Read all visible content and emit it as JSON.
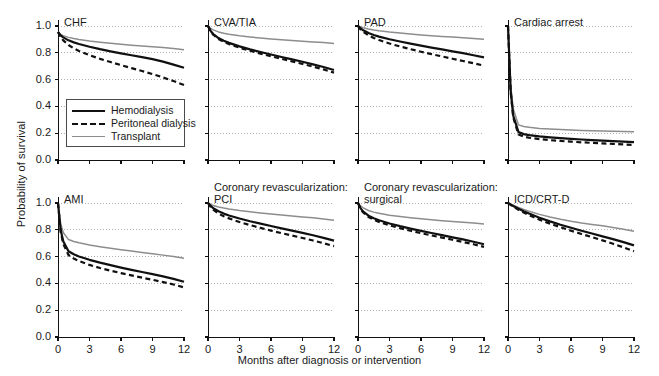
{
  "chart_data": {
    "type": "line",
    "title": "",
    "xlabel": "Months after diagnosis or intervention",
    "ylabel": "Probability of survival",
    "xlim": [
      0,
      12
    ],
    "ylim": [
      0,
      1.0
    ],
    "xticks": [
      "0",
      "3",
      "6",
      "9",
      "12"
    ],
    "xtick_values": [
      0,
      3,
      6,
      9,
      12
    ],
    "yticks": [
      "0.0",
      "0.2",
      "0.4",
      "0.6",
      "0.8",
      "1.0"
    ],
    "ytick_values": [
      0.0,
      0.2,
      0.4,
      0.6,
      0.8,
      1.0
    ],
    "grid": "horizontal-dotted",
    "legend_position": "inside-panel-1-lower-left",
    "legend": [
      {
        "name": "Hemodialysis",
        "style": "solid",
        "color": "#101010",
        "width": 2.2
      },
      {
        "name": "Peritoneal dialysis",
        "style": "dashed",
        "color": "#101010",
        "width": 2.2
      },
      {
        "name": "Transplant",
        "style": "solid",
        "color": "#8d8d8d",
        "width": 1.5
      }
    ],
    "x": [
      0,
      0.25,
      0.5,
      1,
      1.5,
      2,
      3,
      4,
      5,
      6,
      7,
      8,
      9,
      10,
      11,
      12
    ],
    "panels": [
      {
        "title": "CHF",
        "row": 0,
        "col": 0,
        "series": [
          {
            "name": "Hemodialysis",
            "values": [
              0.955,
              0.93,
              0.915,
              0.893,
              0.878,
              0.866,
              0.845,
              0.827,
              0.811,
              0.796,
              0.782,
              0.768,
              0.753,
              0.734,
              0.712,
              0.688
            ]
          },
          {
            "name": "Peritoneal dialysis",
            "values": [
              0.955,
              0.918,
              0.893,
              0.858,
              0.833,
              0.814,
              0.782,
              0.755,
              0.731,
              0.708,
              0.686,
              0.664,
              0.641,
              0.616,
              0.589,
              0.56
            ]
          },
          {
            "name": "Transplant",
            "values": [
              0.955,
              0.938,
              0.928,
              0.915,
              0.906,
              0.899,
              0.888,
              0.879,
              0.871,
              0.864,
              0.857,
              0.851,
              0.845,
              0.839,
              0.832,
              0.823
            ]
          }
        ]
      },
      {
        "title": "CVA/TIA",
        "row": 0,
        "col": 1,
        "series": [
          {
            "name": "Hemodialysis",
            "values": [
              1.0,
              0.963,
              0.94,
              0.91,
              0.89,
              0.874,
              0.848,
              0.826,
              0.806,
              0.787,
              0.769,
              0.751,
              0.733,
              0.714,
              0.694,
              0.672
            ]
          },
          {
            "name": "Peritoneal dialysis",
            "values": [
              1.0,
              0.96,
              0.935,
              0.903,
              0.882,
              0.865,
              0.838,
              0.815,
              0.794,
              0.774,
              0.755,
              0.736,
              0.717,
              0.697,
              0.676,
              0.652
            ]
          },
          {
            "name": "Transplant",
            "values": [
              1.0,
              0.983,
              0.971,
              0.956,
              0.946,
              0.939,
              0.927,
              0.918,
              0.91,
              0.903,
              0.897,
              0.891,
              0.886,
              0.881,
              0.876,
              0.87
            ]
          }
        ]
      },
      {
        "title": "PAD",
        "row": 0,
        "col": 2,
        "series": [
          {
            "name": "Hemodialysis",
            "values": [
              1.0,
              0.982,
              0.968,
              0.948,
              0.933,
              0.921,
              0.901,
              0.884,
              0.868,
              0.853,
              0.839,
              0.825,
              0.811,
              0.797,
              0.782,
              0.766
            ]
          },
          {
            "name": "Peritoneal dialysis",
            "values": [
              1.0,
              0.974,
              0.956,
              0.93,
              0.911,
              0.895,
              0.869,
              0.847,
              0.827,
              0.808,
              0.79,
              0.773,
              0.756,
              0.739,
              0.722,
              0.704
            ]
          },
          {
            "name": "Transplant",
            "values": [
              1.0,
              0.993,
              0.987,
              0.978,
              0.971,
              0.965,
              0.955,
              0.947,
              0.94,
              0.933,
              0.927,
              0.922,
              0.917,
              0.912,
              0.907,
              0.901
            ]
          }
        ]
      },
      {
        "title": "Cardiac arrest",
        "row": 0,
        "col": 3,
        "series": [
          {
            "name": "Hemodialysis",
            "values": [
              1.0,
              0.52,
              0.33,
              0.208,
              0.193,
              0.186,
              0.176,
              0.169,
              0.163,
              0.158,
              0.153,
              0.149,
              0.145,
              0.141,
              0.137,
              0.133
            ]
          },
          {
            "name": "Peritoneal dialysis",
            "values": [
              1.0,
              0.51,
              0.318,
              0.19,
              0.174,
              0.166,
              0.156,
              0.148,
              0.142,
              0.137,
              0.132,
              0.128,
              0.124,
              0.12,
              0.116,
              0.112
            ]
          },
          {
            "name": "Transplant",
            "values": [
              1.0,
              0.56,
              0.38,
              0.262,
              0.25,
              0.244,
              0.236,
              0.231,
              0.227,
              0.224,
              0.221,
              0.219,
              0.217,
              0.215,
              0.213,
              0.211
            ]
          }
        ]
      },
      {
        "title": "AMI",
        "row": 1,
        "col": 0,
        "series": [
          {
            "name": "Hemodialysis",
            "values": [
              1.0,
              0.8,
              0.715,
              0.64,
              0.617,
              0.601,
              0.576,
              0.555,
              0.536,
              0.518,
              0.501,
              0.485,
              0.469,
              0.452,
              0.434,
              0.412
            ]
          },
          {
            "name": "Peritoneal dialysis",
            "values": [
              1.0,
              0.785,
              0.695,
              0.612,
              0.585,
              0.567,
              0.538,
              0.515,
              0.495,
              0.477,
              0.46,
              0.443,
              0.427,
              0.41,
              0.392,
              0.37
            ]
          },
          {
            "name": "Transplant",
            "values": [
              1.0,
              0.845,
              0.78,
              0.727,
              0.713,
              0.703,
              0.687,
              0.674,
              0.662,
              0.651,
              0.641,
              0.631,
              0.621,
              0.611,
              0.6,
              0.588
            ]
          }
        ]
      },
      {
        "title": "Coronary revascularization:\nPCI",
        "title_lines": [
          "Coronary revascularization:",
          "PCI"
        ],
        "row": 1,
        "col": 1,
        "series": [
          {
            "name": "Hemodialysis",
            "values": [
              1.0,
              0.978,
              0.962,
              0.938,
              0.921,
              0.907,
              0.884,
              0.864,
              0.846,
              0.828,
              0.811,
              0.794,
              0.777,
              0.759,
              0.74,
              0.719
            ]
          },
          {
            "name": "Peritoneal dialysis",
            "values": [
              1.0,
              0.97,
              0.95,
              0.921,
              0.901,
              0.885,
              0.858,
              0.835,
              0.814,
              0.794,
              0.775,
              0.757,
              0.739,
              0.72,
              0.7,
              0.678
            ]
          },
          {
            "name": "Transplant",
            "values": [
              1.0,
              0.99,
              0.982,
              0.97,
              0.962,
              0.955,
              0.944,
              0.935,
              0.926,
              0.918,
              0.911,
              0.903,
              0.896,
              0.889,
              0.881,
              0.872
            ]
          }
        ]
      },
      {
        "title": "Coronary revascularization:\nsurgical",
        "title_lines": [
          "Coronary revascularization:",
          "surgical"
        ],
        "row": 1,
        "col": 2,
        "series": [
          {
            "name": "Hemodialysis",
            "values": [
              1.0,
              0.96,
              0.936,
              0.905,
              0.886,
              0.871,
              0.847,
              0.827,
              0.809,
              0.792,
              0.776,
              0.76,
              0.744,
              0.728,
              0.711,
              0.692
            ]
          },
          {
            "name": "Peritoneal dialysis",
            "values": [
              1.0,
              0.955,
              0.929,
              0.896,
              0.875,
              0.859,
              0.833,
              0.812,
              0.793,
              0.775,
              0.758,
              0.742,
              0.726,
              0.709,
              0.692,
              0.673
            ]
          },
          {
            "name": "Transplant",
            "values": [
              1.0,
              0.978,
              0.964,
              0.944,
              0.932,
              0.923,
              0.909,
              0.899,
              0.89,
              0.882,
              0.875,
              0.868,
              0.862,
              0.856,
              0.85,
              0.843
            ]
          }
        ]
      },
      {
        "title": "ICD/CRT-D",
        "row": 1,
        "col": 3,
        "series": [
          {
            "name": "Hemodialysis",
            "values": [
              1.0,
              0.988,
              0.977,
              0.957,
              0.938,
              0.921,
              0.89,
              0.863,
              0.838,
              0.815,
              0.793,
              0.772,
              0.751,
              0.73,
              0.708,
              0.684
            ]
          },
          {
            "name": "Peritoneal dialysis",
            "values": [
              1.0,
              0.986,
              0.973,
              0.95,
              0.929,
              0.91,
              0.876,
              0.846,
              0.819,
              0.793,
              0.769,
              0.745,
              0.721,
              0.696,
              0.669,
              0.64
            ]
          },
          {
            "name": "Transplant",
            "values": [
              1.0,
              0.991,
              0.983,
              0.967,
              0.952,
              0.939,
              0.915,
              0.896,
              0.879,
              0.864,
              0.851,
              0.84,
              0.83,
              0.818,
              0.804,
              0.79
            ]
          }
        ]
      }
    ]
  }
}
